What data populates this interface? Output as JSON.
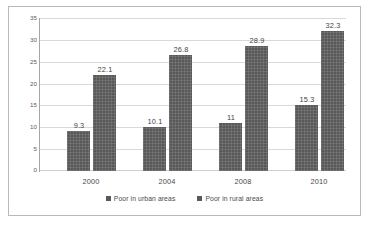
{
  "chart_data": {
    "type": "bar",
    "title": "",
    "subtitle": "",
    "xlabel": "",
    "ylabel": "",
    "categories": [
      "2000",
      "2004",
      "2008",
      "2010"
    ],
    "series": [
      {
        "name": "Poor in urban areas",
        "color": "#595959",
        "values": [
          9.3,
          10.1,
          11,
          15.3
        ],
        "labels": [
          "9.3",
          "10.1",
          "11",
          "15.3"
        ]
      },
      {
        "name": "Poor in rural areas",
        "color": "#595959",
        "values": [
          22.1,
          26.8,
          28.9,
          32.3
        ],
        "labels": [
          "22.1",
          "26.8",
          "28.9",
          "32.3"
        ]
      }
    ],
    "ylim": [
      0,
      35
    ],
    "ytick_step": 5,
    "yticks": [
      "35",
      "30",
      "25",
      "20",
      "15",
      "10",
      "5",
      "0"
    ],
    "grid": true,
    "grid_axis": "y",
    "legend_position": "bottom-center",
    "data_labels": true,
    "plot_background": "#ffffff",
    "gridline_color": "#d9d9d9",
    "axis_color": "#a6a6a6",
    "border_color": "#b9b9b9"
  },
  "legend": {
    "entries": [
      {
        "label": "Poor in urban areas",
        "swatch": "legend-swatch-urban"
      },
      {
        "label": "Poor in rural areas",
        "swatch": "legend-swatch-rural"
      }
    ]
  }
}
